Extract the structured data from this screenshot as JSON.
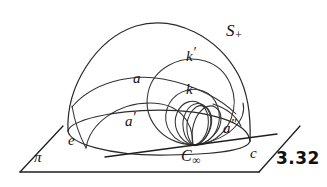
{
  "figure": {
    "number": "3.32",
    "background_color": "#ffffff",
    "ink_color": "#2b2b2b"
  },
  "labels": {
    "hemisphere": {
      "base": "S",
      "sub": "+"
    },
    "circle_k_prime": {
      "base": "k",
      "prime": "′"
    },
    "circle_a": {
      "base": "a"
    },
    "circle_k": {
      "base": "k"
    },
    "circle_a_prime": {
      "base": "a",
      "prime": "′"
    },
    "circle_a_double_prime": {
      "base": "a",
      "prime": "″"
    },
    "ellipse_e": {
      "base": "e"
    },
    "point_c_infinity": {
      "base": "C",
      "sub": "∞"
    },
    "line_c": {
      "base": "c"
    },
    "plane_pi": {
      "base": "π"
    },
    "figure_number": "3.32"
  },
  "geometry": {
    "plane_corners": [
      [
        20,
        172
      ],
      [
        62,
        127
      ],
      [
        299,
        127
      ],
      [
        258,
        172
      ]
    ],
    "c_infinity_point": [
      193,
      145
    ],
    "dome_apex": [
      160,
      22
    ],
    "dome_left_foot": [
      68,
      131
    ],
    "dome_right_foot": [
      250,
      141
    ],
    "base_ellipse_center": [
      159,
      130
    ],
    "base_ellipse_rx": 91,
    "base_ellipse_ry": 20
  }
}
